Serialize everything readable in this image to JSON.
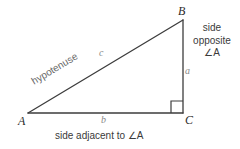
{
  "diagram": {
    "background_color": "#ffffff",
    "line_color": "#3c3c3c",
    "text_color": "#3a3a3a",
    "variable_color": "#8a8a8a"
  },
  "vertices": {
    "a": {
      "label": "A",
      "x": 28,
      "y": 113
    },
    "b": {
      "label": "B",
      "x": 183,
      "y": 20
    },
    "c": {
      "label": "C",
      "x": 183,
      "y": 113
    }
  },
  "sides": {
    "opposite": {
      "variable": "a",
      "description_lines": [
        "side",
        "opposite",
        "∠A"
      ]
    },
    "adjacent": {
      "variable": "b",
      "description": "side adjacent to ∠A"
    },
    "hypotenuse": {
      "variable": "c",
      "description": "hypotenuse"
    }
  },
  "markers": {
    "right_angle": {
      "name": "right-angle-marker",
      "at_vertex": "C",
      "size": 12
    }
  }
}
